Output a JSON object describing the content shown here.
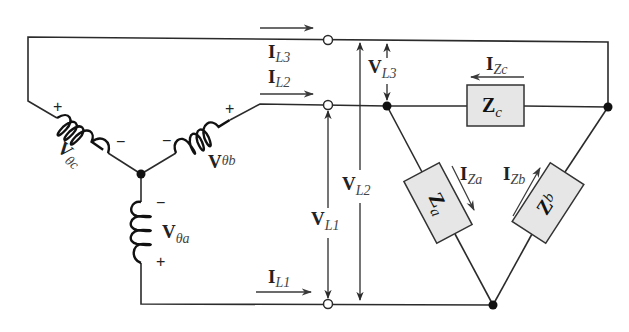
{
  "source": {
    "phases": [
      {
        "id": "a",
        "label_main": "V",
        "label_sub": "θa",
        "polarity": [
          "−",
          "+"
        ]
      },
      {
        "id": "b",
        "label_main": "V",
        "label_sub": "θb",
        "polarity": [
          "−",
          "+"
        ]
      },
      {
        "id": "c",
        "label_main": "V",
        "label_sub": "θc",
        "polarity": [
          "+",
          "−"
        ]
      }
    ]
  },
  "line_currents": [
    {
      "id": "L1",
      "label_main": "I",
      "label_sub": "L1"
    },
    {
      "id": "L2",
      "label_main": "I",
      "label_sub": "L2"
    },
    {
      "id": "L3",
      "label_main": "I",
      "label_sub": "L3"
    }
  ],
  "line_voltages": [
    {
      "id": "L1",
      "label_main": "V",
      "label_sub": "L1"
    },
    {
      "id": "L2",
      "label_main": "V",
      "label_sub": "L2"
    },
    {
      "id": "L3",
      "label_main": "V",
      "label_sub": "L3"
    }
  ],
  "load": {
    "impedances": [
      {
        "id": "a",
        "label_main": "Z",
        "label_sub": "a",
        "current_main": "I",
        "current_sub": "Za"
      },
      {
        "id": "b",
        "label_main": "Z",
        "label_sub": "b",
        "current_main": "I",
        "current_sub": "Zb"
      },
      {
        "id": "c",
        "label_main": "Z",
        "label_sub": "c",
        "current_main": "I",
        "current_sub": "Zc"
      }
    ]
  },
  "colors": {
    "wire": "#2b2b2b",
    "impedance_fill": "#e6e6e6"
  }
}
